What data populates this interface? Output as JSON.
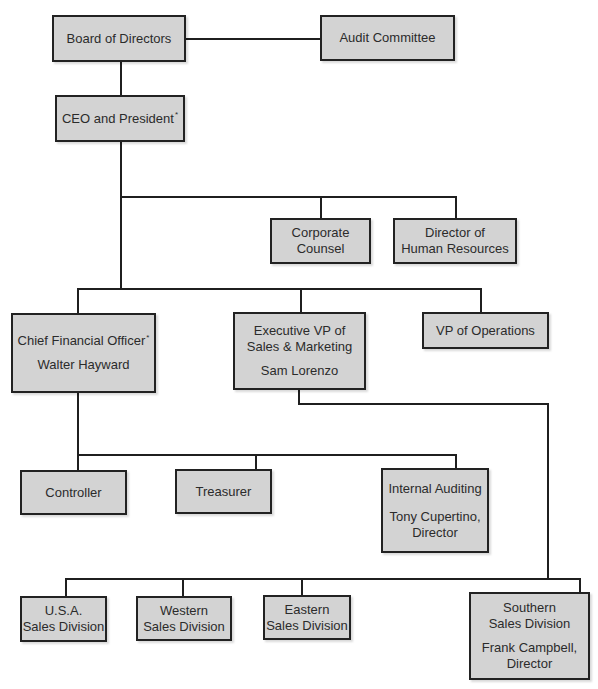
{
  "diagram": {
    "type": "organization-chart",
    "nodes": {
      "board": {
        "lines": [
          "Board of Directors"
        ]
      },
      "audit": {
        "lines": [
          "Audit Committee"
        ]
      },
      "ceo": {
        "lines": [
          "CEO and President"
        ],
        "footnote": "*"
      },
      "counsel": {
        "lines": [
          "Corporate",
          "Counsel"
        ]
      },
      "hr": {
        "lines": [
          "Director of",
          "Human Resources"
        ]
      },
      "cfo": {
        "lines": [
          "Chief Financial Officer"
        ],
        "footnote": "*",
        "person": [
          "Walter Hayward"
        ]
      },
      "evp": {
        "lines": [
          "Executive VP of",
          "Sales & Marketing"
        ],
        "person": [
          "Sam Lorenzo"
        ]
      },
      "vpops": {
        "lines": [
          "VP of Operations"
        ]
      },
      "controller": {
        "lines": [
          "Controller"
        ]
      },
      "treasurer": {
        "lines": [
          "Treasurer"
        ]
      },
      "internal_audit": {
        "lines": [
          "Internal Auditing"
        ],
        "person": [
          "Tony Cupertino,",
          "Director"
        ]
      },
      "usa": {
        "lines": [
          "U.S.A.",
          "Sales Division"
        ]
      },
      "western": {
        "lines": [
          "Western",
          "Sales Division"
        ]
      },
      "eastern": {
        "lines": [
          "Eastern",
          "Sales Division"
        ]
      },
      "southern": {
        "lines": [
          "Southern",
          "Sales Division"
        ],
        "person": [
          "Frank Campbell,",
          "Director"
        ]
      }
    },
    "edges": [
      [
        "board",
        "audit"
      ],
      [
        "board",
        "ceo"
      ],
      [
        "ceo",
        "counsel"
      ],
      [
        "ceo",
        "hr"
      ],
      [
        "ceo",
        "cfo"
      ],
      [
        "ceo",
        "evp"
      ],
      [
        "ceo",
        "vpops"
      ],
      [
        "cfo",
        "controller"
      ],
      [
        "cfo",
        "treasurer"
      ],
      [
        "cfo",
        "internal_audit"
      ],
      [
        "evp",
        "usa"
      ],
      [
        "evp",
        "western"
      ],
      [
        "evp",
        "eastern"
      ],
      [
        "evp",
        "southern"
      ]
    ],
    "colors": {
      "box_fill": "#d3d3d3",
      "box_border": "#222222",
      "connector": "#1f1f1f",
      "text": "#2b2b2b"
    }
  }
}
